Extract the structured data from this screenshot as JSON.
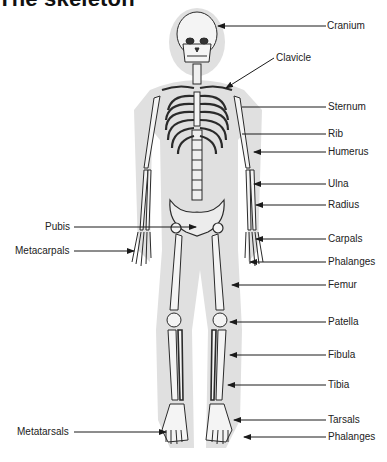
{
  "title": "The skeleton",
  "colors": {
    "silhouette": "#dedede",
    "bone": "#f4f4f4",
    "bone_outline": "#2a2a2a",
    "leader": "#1a1a1a",
    "text": "#222222"
  },
  "labels_right": [
    {
      "text": "Cranium",
      "x": 327,
      "y": 21
    },
    {
      "text": "Clavicle",
      "x": 276,
      "y": 52
    },
    {
      "text": "Sternum",
      "x": 328,
      "y": 102
    },
    {
      "text": "Rib",
      "x": 328,
      "y": 129
    },
    {
      "text": "Humerus",
      "x": 328,
      "y": 147
    },
    {
      "text": "Ulna",
      "x": 328,
      "y": 179
    },
    {
      "text": "Radius",
      "x": 328,
      "y": 200
    },
    {
      "text": "Carpals",
      "x": 328,
      "y": 234
    },
    {
      "text": "Phalanges",
      "x": 328,
      "y": 257
    },
    {
      "text": "Femur",
      "x": 328,
      "y": 280
    },
    {
      "text": "Patella",
      "x": 328,
      "y": 317
    },
    {
      "text": "Fibula",
      "x": 328,
      "y": 350
    },
    {
      "text": "Tibia",
      "x": 328,
      "y": 380
    },
    {
      "text": "Tarsals",
      "x": 328,
      "y": 415
    },
    {
      "text": "Phalanges",
      "x": 328,
      "y": 432
    }
  ],
  "labels_left": [
    {
      "text": "Pubis",
      "x": 45,
      "y": 222
    },
    {
      "text": "Metacarpals",
      "x": 15,
      "y": 246
    },
    {
      "text": "Metatarsals",
      "x": 17,
      "y": 427
    }
  ]
}
